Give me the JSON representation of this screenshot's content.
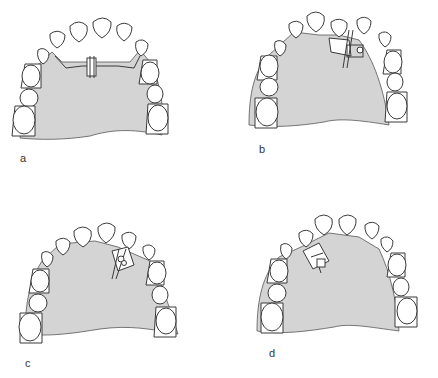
{
  "figure": {
    "colors": {
      "background": "#ffffff",
      "palate_fill": "#d4d4d4",
      "outline": "#3a3a3a",
      "tooth_fill": "#ffffff"
    },
    "panels": [
      {
        "id": "a",
        "label": "a",
        "appliance": "midline expansion screw with transverse wire"
      },
      {
        "id": "b",
        "label": "b",
        "appliance": "spring with guide box (right anterior)"
      },
      {
        "id": "c",
        "label": "c",
        "appliance": "screw in box (right lateral region)"
      },
      {
        "id": "d",
        "label": "d",
        "appliance": "screw in box (left lateral region)"
      }
    ]
  }
}
